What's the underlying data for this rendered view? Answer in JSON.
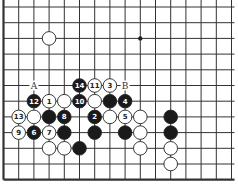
{
  "board": {
    "columns": 16,
    "rows": 12,
    "origin_x": 3.5,
    "origin_y": 7,
    "spacing_x": 15.2,
    "spacing_y": 15.7,
    "thick_edges": [
      "left",
      "bottom"
    ],
    "line_color": "#333333",
    "star_points": [
      {
        "col": 9,
        "row": 2
      }
    ]
  },
  "stones": [
    {
      "col": 3,
      "row": 2,
      "color": "white",
      "label": ""
    },
    {
      "col": 5,
      "row": 5,
      "color": "black",
      "label": "14"
    },
    {
      "col": 6,
      "row": 5,
      "color": "white",
      "label": "11"
    },
    {
      "col": 7,
      "row": 5,
      "color": "white",
      "label": "3"
    },
    {
      "col": 2,
      "row": 6,
      "color": "black",
      "label": "12"
    },
    {
      "col": 3,
      "row": 6,
      "color": "white",
      "label": "1"
    },
    {
      "col": 4,
      "row": 6,
      "color": "white",
      "label": ""
    },
    {
      "col": 5,
      "row": 6,
      "color": "black",
      "label": "10"
    },
    {
      "col": 6,
      "row": 6,
      "color": "white",
      "label": ""
    },
    {
      "col": 7,
      "row": 6,
      "color": "black",
      "label": ""
    },
    {
      "col": 8,
      "row": 6,
      "color": "black",
      "label": "4"
    },
    {
      "col": 1,
      "row": 7,
      "color": "white",
      "label": "13"
    },
    {
      "col": 2,
      "row": 7,
      "color": "white",
      "label": ""
    },
    {
      "col": 3,
      "row": 7,
      "color": "black",
      "label": ""
    },
    {
      "col": 4,
      "row": 7,
      "color": "black",
      "label": "8"
    },
    {
      "col": 6,
      "row": 7,
      "color": "black",
      "label": "2"
    },
    {
      "col": 7,
      "row": 7,
      "color": "white",
      "label": ""
    },
    {
      "col": 8,
      "row": 7,
      "color": "white",
      "label": "5"
    },
    {
      "col": 9,
      "row": 7,
      "color": "white",
      "label": ""
    },
    {
      "col": 11,
      "row": 7,
      "color": "black",
      "label": ""
    },
    {
      "col": 1,
      "row": 8,
      "color": "white",
      "label": "9"
    },
    {
      "col": 2,
      "row": 8,
      "color": "black",
      "label": "6"
    },
    {
      "col": 3,
      "row": 8,
      "color": "white",
      "label": "7"
    },
    {
      "col": 4,
      "row": 8,
      "color": "black",
      "label": ""
    },
    {
      "col": 6,
      "row": 8,
      "color": "black",
      "label": ""
    },
    {
      "col": 8,
      "row": 8,
      "color": "black",
      "label": ""
    },
    {
      "col": 9,
      "row": 8,
      "color": "white",
      "label": ""
    },
    {
      "col": 11,
      "row": 8,
      "color": "black",
      "label": ""
    },
    {
      "col": 3,
      "row": 9,
      "color": "white",
      "label": ""
    },
    {
      "col": 4,
      "row": 9,
      "color": "white",
      "label": ""
    },
    {
      "col": 5,
      "row": 9,
      "color": "black",
      "label": ""
    },
    {
      "col": 9,
      "row": 9,
      "color": "white",
      "label": ""
    },
    {
      "col": 11,
      "row": 9,
      "color": "white",
      "label": ""
    },
    {
      "col": 11,
      "row": 10,
      "color": "white",
      "label": ""
    }
  ],
  "point_labels": [
    {
      "col": 2,
      "row": 5,
      "text": "A"
    },
    {
      "col": 8,
      "row": 5,
      "text": "B"
    }
  ]
}
